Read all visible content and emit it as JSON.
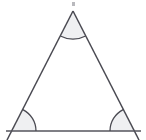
{
  "figure": {
    "shape_name": "triangle",
    "background_color": "#ffffff",
    "stroke_color": "#4a4a52",
    "angle_fill_color": "#eff0f2",
    "base_line_color": "#55555d",
    "vertex_count": 3,
    "marked_angle_count": 3,
    "labels": [],
    "vertices": [
      {
        "name": "apex",
        "x": 73,
        "y": 11
      },
      {
        "name": "bottom-left",
        "x": 12,
        "y": 131
      },
      {
        "name": "bottom-right",
        "x": 134,
        "y": 131
      }
    ],
    "base_line": {
      "x1": 6,
      "y1": 131,
      "x2": 141,
      "y2": 131
    },
    "side_overshoot": {
      "left": {
        "x": 7,
        "y": 140
      },
      "right": {
        "x": 139,
        "y": 140
      }
    },
    "angle_marks": [
      {
        "name": "apex-angle-arc",
        "vertex": "apex",
        "radius": 28
      },
      {
        "name": "bottom-left-angle-arc",
        "vertex": "bottom-left",
        "radius": 24
      },
      {
        "name": "bottom-right-angle-arc",
        "vertex": "bottom-right",
        "radius": 24
      }
    ],
    "artifact": {
      "name": "top-speck",
      "x": 72,
      "y": 2,
      "width": 3,
      "height": 4
    }
  }
}
